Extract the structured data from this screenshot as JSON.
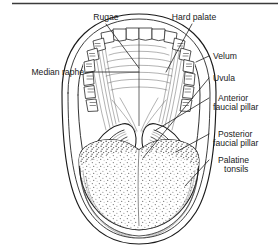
{
  "figure": {
    "view": "Anterior view of the open mouth showing palate, tongue and faucial pillars",
    "background_color": "#ffffff",
    "ink_color": "#1b1b1b",
    "rule_color": "#3b3b3b"
  },
  "labels": {
    "rugae": "Rugae",
    "hard_palate": "Hard palate",
    "median_raphe": "Median raphe",
    "velum": "Velum",
    "uvula": "Uvula",
    "anterior_faucial_pillar_line1": "Anterior",
    "anterior_faucial_pillar_line2": "faucial pillar",
    "posterior_faucial_pillar_line1": "Posterior",
    "posterior_faucial_pillar_line2": "faucial pillar",
    "palatine_tonsils_line1": "Palatine",
    "palatine_tonsils_line2": "tonsils"
  },
  "structures": [
    {
      "name": "rugae",
      "label": "Rugae",
      "side": "top-left"
    },
    {
      "name": "hard-palate",
      "label": "Hard palate",
      "side": "top-right"
    },
    {
      "name": "median-raphe",
      "label": "Median raphe",
      "side": "left"
    },
    {
      "name": "velum",
      "label": "Velum",
      "side": "right"
    },
    {
      "name": "uvula",
      "label": "Uvula",
      "side": "right"
    },
    {
      "name": "anterior-faucial-pillar",
      "label": "Anterior faucial pillar",
      "side": "right"
    },
    {
      "name": "posterior-faucial-pillar",
      "label": "Posterior faucial pillar",
      "side": "right"
    },
    {
      "name": "palatine-tonsils",
      "label": "Palatine tonsils",
      "side": "right"
    }
  ]
}
